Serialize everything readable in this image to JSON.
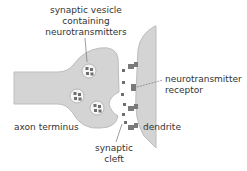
{
  "labels": {
    "vesicle_line1": "synaptic vesicle",
    "vesicle_line2": "containing",
    "vesicle_line3": "neurotransmitters",
    "receptor_line1": "neurotransmitter",
    "receptor_line2": "receptor",
    "axon": "axon terminus",
    "dendrite": "dendrite",
    "cleft_line1": "synaptic",
    "cleft_line2": "cleft"
  },
  "colors": {
    "cell_fill": "#d4d4d4",
    "cell_stroke": "#bdbdbd",
    "vesicle_fill": "#f5f5f5",
    "particle": "#6e6e6e",
    "receptor": "#7a7a7a",
    "text": "#333333"
  }
}
